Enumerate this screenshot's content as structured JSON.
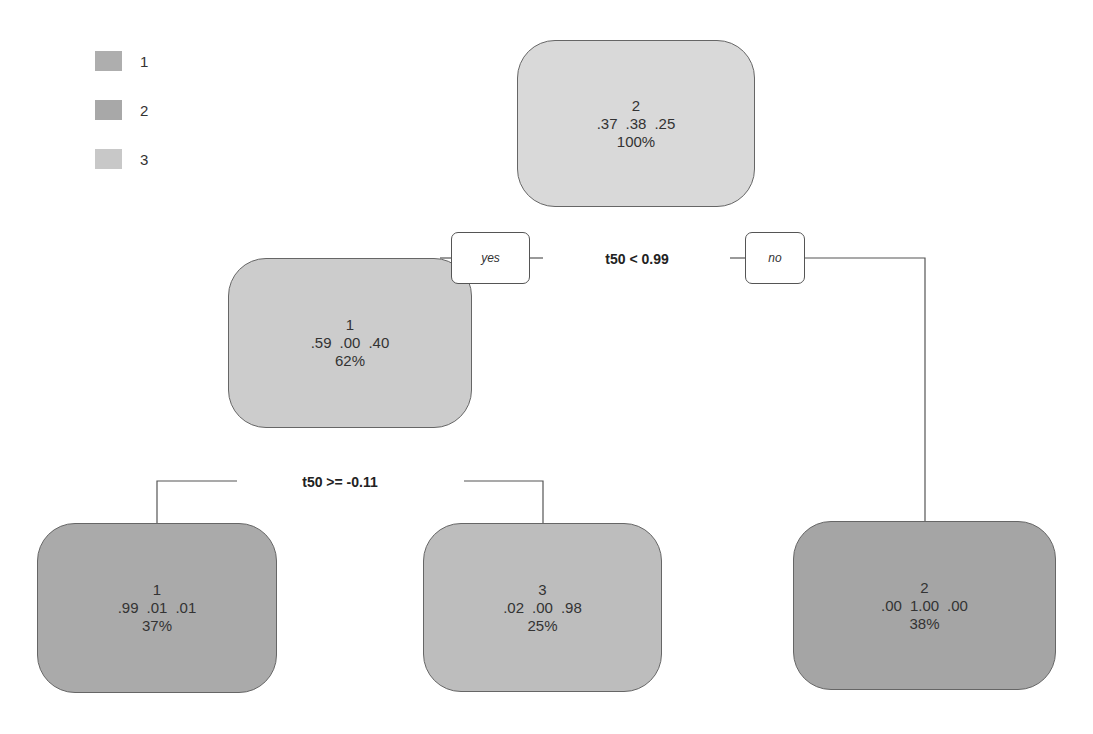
{
  "legend": [
    {
      "label": "1",
      "color": "#aeaeae"
    },
    {
      "label": "2",
      "color": "#a8a8a8"
    },
    {
      "label": "3",
      "color": "#c8c8c8"
    }
  ],
  "colors": {
    "root_fill": "#d9d9d9",
    "mid_fill": "#cccccc",
    "leaf1_fill": "#aaaaaa",
    "leaf3_fill": "#bdbdbd",
    "leaf2_fill": "#a5a5a5",
    "line": "#555555"
  },
  "nodes": {
    "root": {
      "cls": "2",
      "probs": [
        ".37",
        ".38",
        ".25"
      ],
      "pct": "100%"
    },
    "left": {
      "cls": "1",
      "probs": [
        ".59",
        ".00",
        ".40"
      ],
      "pct": "62%"
    },
    "leaf_left": {
      "cls": "1",
      "probs": [
        ".99",
        ".01",
        ".01"
      ],
      "pct": "37%"
    },
    "leaf_mid": {
      "cls": "3",
      "probs": [
        ".02",
        ".00",
        ".98"
      ],
      "pct": "25%"
    },
    "leaf_right": {
      "cls": "2",
      "probs": [
        ".00",
        "1.00",
        ".00"
      ],
      "pct": "38%"
    }
  },
  "splits": {
    "root": "t50 < 0.99",
    "left": "t50 >= -0.11"
  },
  "branch_tags": {
    "yes": "yes",
    "no": "no"
  }
}
